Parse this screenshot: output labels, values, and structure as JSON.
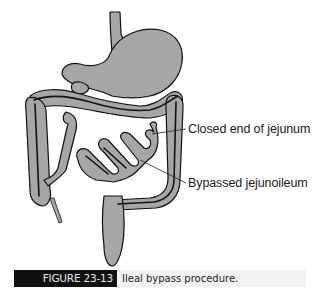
{
  "figure": {
    "labels": {
      "closed_end": "Closed end of jejunum",
      "bypassed": "Bypassed jejunoileum"
    },
    "caption": {
      "number": "FIGURE 23-13",
      "text": "Ileal bypass procedure."
    },
    "organs": [
      "esophagus",
      "stomach",
      "duodenum",
      "transverse colon",
      "ascending colon",
      "descending colon",
      "jejunum",
      "ileum",
      "appendix",
      "rectum"
    ],
    "colors": {
      "organ_fill": "#a6a6a6",
      "outline": "#111111",
      "caption_tag_bg": "#111111",
      "caption_bg": "#f2f2f2"
    }
  }
}
